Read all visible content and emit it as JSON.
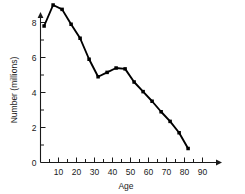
{
  "chart_data": {
    "type": "line",
    "title": "",
    "xlabel": "Age",
    "ylabel": "Number (millions)",
    "xlim": [
      0,
      95
    ],
    "ylim": [
      0,
      9.6
    ],
    "grid": false,
    "legend": null,
    "x_major_ticks": [
      10,
      20,
      30,
      40,
      50,
      60,
      70,
      80,
      90
    ],
    "x_major_tick_labels": [
      "10",
      "20",
      "30",
      "40",
      "50",
      "60",
      "70",
      "80",
      "90"
    ],
    "x_minor_ticks": [
      5,
      15,
      25,
      35,
      45,
      55,
      65,
      75,
      85
    ],
    "y_major_ticks": [
      0,
      2,
      4,
      6,
      8
    ],
    "y_major_tick_labels": [
      "0",
      "2",
      "4",
      "6",
      "8"
    ],
    "y_minor_ticks": [
      1,
      3,
      5,
      7,
      9
    ],
    "marker": "square",
    "line_color": "#000000",
    "marker_color": "#000000",
    "axis_color": "#1a1a1a",
    "x": [
      2,
      7,
      12,
      17,
      22,
      27,
      32,
      37,
      42,
      47,
      52,
      57,
      62,
      67,
      72,
      77,
      82
    ],
    "y": [
      7.8,
      9.0,
      8.75,
      7.9,
      7.1,
      5.9,
      4.9,
      5.15,
      5.4,
      5.35,
      4.6,
      4.05,
      3.5,
      2.9,
      2.35,
      1.7,
      0.8
    ],
    "series": [
      {
        "name": "Number (millions)",
        "values": [
          7.8,
          9.0,
          8.75,
          7.9,
          7.1,
          5.9,
          4.9,
          5.15,
          5.4,
          5.35,
          4.6,
          4.05,
          3.5,
          2.9,
          2.35,
          1.7,
          0.8
        ]
      }
    ]
  }
}
